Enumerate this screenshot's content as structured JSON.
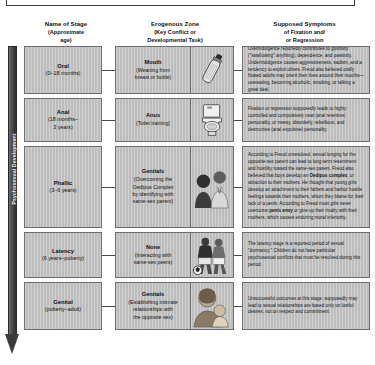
{
  "top_caption": "Freud proposed that personality develops through a series of psychosexual stages, each focused on a distinct erogenous zone.",
  "axis": {
    "label": "Psychosexual Development"
  },
  "headers": [
    {
      "title": "Name of Stage",
      "sub": "(Approximate\nage)"
    },
    {
      "title": "Erogenous Zone",
      "sub": "(Key Conflict or\nDevelopmental Task)"
    },
    {
      "title": "Supposed Symptoms",
      "sub": "of Fixation and/\nor Regression"
    }
  ],
  "rows": [
    {
      "stage_name": "Oral",
      "stage_age": "(0–18 months)",
      "zone_name": "Mouth",
      "zone_task": "(Weaning from\nbreast or bottle)",
      "icon": "baby-bottle-icon",
      "symptoms": "Overindulgence reportedly contributes to gullibility (\"swallowing\" anything), dependence, and passivity. Underindulgence causes aggressiveness, sadism, and a tendency to exploit others. Freud also believed orally fixated adults may orient their lives around their mouths—overeating, becoming alcoholic, smoking, or talking a great deal."
    },
    {
      "stage_name": "Anal",
      "stage_age": "(18 months–\n3 years)",
      "zone_name": "Anus",
      "zone_task": "(Toilet training)",
      "icon": "toilet-icon",
      "symptoms": "Fixation or regression supposedly leads to highly controlled and compulsively neat (anal retentive) personality, or messy, disorderly, rebellious, and destructive (anal expulsive) personality."
    },
    {
      "stage_name": "Phallic",
      "stage_age": "(3–6 years)",
      "zone_name": "Genitals",
      "zone_task": "(Overcoming the\nOedipus Complex\nby identifying with\nsame-sex parent)",
      "icon": "parent-and-child-icon",
      "symptoms": "According to Freud unresolved, sexual longing for the opposite-sex parent can lead to long-term resentment and hostility toward the same-sex parent. Freud also believed that boys develop an Oedipus complex, or attraction to their mothers. He thought that young girls develop an attachment to their fathers and harbor hostile feelings towards their mothers, whom they blame for their lack of a penis. According to Freud most girls never overcome penis envy or give up their rivalry with their mothers, which causes enduring moral inferiority."
    },
    {
      "stage_name": "Latency",
      "stage_age": "(6 years–puberty)",
      "zone_name": "None",
      "zone_task": "(Interacting with\nsame-sex peers)",
      "icon": "soccer-players-icon",
      "symptoms": "The latency stage is a reported period of sexual \"dormancy.\" Children do not have particular psychosexual conflicts that must be resolved during this period."
    },
    {
      "stage_name": "Genital",
      "stage_age": "(puberty–adult)",
      "zone_name": "Genitals",
      "zone_task": "(Establishing intimate\nrelationships with\nthe opposite sex)",
      "icon": "embracing-couple-icon",
      "symptoms": "Unsuccessful outcomes at this stage, supposedly may lead to sexual relationships are based only on lustful desires, not on respect and commitment."
    }
  ],
  "colors": {
    "cell_fill": "#bdbdbd",
    "cell_border": "#6d6d6d",
    "axis": "#3a3a3a",
    "text": "#111111"
  }
}
